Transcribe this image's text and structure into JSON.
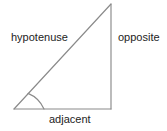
{
  "diagram": {
    "type": "right-triangle-trigonometry",
    "background_color": "#ffffff",
    "stroke_color": "#8a8a8a",
    "text_color": "#232323",
    "labels": {
      "hypotenuse": "hypotenuse",
      "opposite": "opposite",
      "adjacent": "adjacent"
    },
    "geometry": {
      "vertex_bottom_left": [
        14,
        109
      ],
      "vertex_bottom_right": [
        111,
        109
      ],
      "vertex_top_right": [
        111,
        4
      ],
      "angle_arc_radius": 30
    }
  }
}
